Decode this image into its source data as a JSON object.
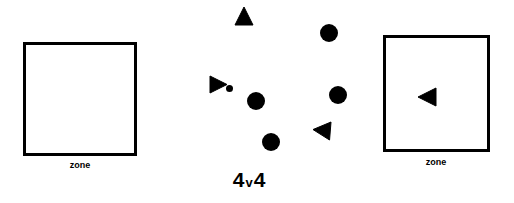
{
  "canvas": {
    "width": 514,
    "height": 203,
    "background_color": "#ffffff",
    "ink_color": "#000000"
  },
  "title": {
    "full_text": "4v4",
    "left_number": "4",
    "separator": "v",
    "right_number": "4",
    "x": 249,
    "y": 180
  },
  "zones": [
    {
      "id": "left-zone",
      "label": "zone",
      "x": 23,
      "y": 42,
      "width": 114,
      "height": 114,
      "border_width": 3,
      "border_color": "#000000",
      "label_x": 80,
      "label_y": 166
    },
    {
      "id": "right-zone",
      "label": "zone",
      "x": 383,
      "y": 35,
      "width": 107,
      "height": 117,
      "border_width": 3,
      "border_color": "#000000",
      "label_x": 436,
      "label_y": 163
    }
  ],
  "markers": [
    {
      "id": "triangle-top",
      "shape": "triangle",
      "direction": "up",
      "cx": 244,
      "cy": 16,
      "size": 18,
      "color": "#000000"
    },
    {
      "id": "triangle-left",
      "shape": "triangle",
      "direction": "right",
      "cx": 218,
      "cy": 84,
      "size": 17,
      "color": "#000000"
    },
    {
      "id": "triangle-bottom-right",
      "shape": "triangle",
      "direction": "down-left",
      "cx": 322,
      "cy": 131,
      "size": 18,
      "color": "#000000"
    },
    {
      "id": "triangle-in-right-zone",
      "shape": "triangle",
      "direction": "left",
      "cx": 427,
      "cy": 97,
      "size": 18,
      "color": "#000000"
    },
    {
      "id": "circle-upper-right",
      "shape": "circle",
      "cx": 329,
      "cy": 33,
      "radius": 9,
      "color": "#000000"
    },
    {
      "id": "circle-center",
      "shape": "circle",
      "cx": 256,
      "cy": 101,
      "radius": 9,
      "color": "#000000"
    },
    {
      "id": "circle-right",
      "shape": "circle",
      "cx": 338,
      "cy": 95,
      "radius": 9,
      "color": "#000000"
    },
    {
      "id": "circle-bottom",
      "shape": "circle",
      "cx": 271,
      "cy": 142,
      "radius": 9,
      "color": "#000000"
    },
    {
      "id": "ball",
      "shape": "circle",
      "cx": 229,
      "cy": 88,
      "radius": 3.5,
      "color": "#000000"
    }
  ],
  "fonts": {
    "title_size_px": 21,
    "zone_label_size_px": 9
  }
}
